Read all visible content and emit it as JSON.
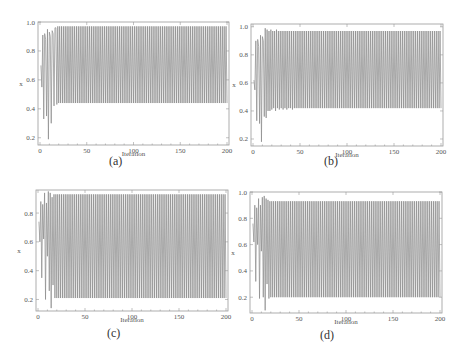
{
  "chart_data": [
    {
      "type": "line",
      "panel": "a",
      "caption": "(a)",
      "xlabel": "Iteration",
      "ylabel": "x",
      "xlim": [
        0,
        200
      ],
      "ylim": [
        0.15,
        1.0
      ],
      "xticks": [
        0,
        50,
        100,
        150,
        200
      ],
      "yticks": [
        0.2,
        0.4,
        0.6,
        0.8,
        1.0
      ],
      "ytick_labels": [
        "0.2",
        "0.4",
        "0.6",
        "0.8",
        "1.0"
      ],
      "steady_state": {
        "high": 0.97,
        "low": 0.44,
        "from_iteration": 18
      },
      "transient": [
        0.7,
        0.55,
        0.91,
        0.33,
        0.92,
        0.88,
        0.35,
        0.95,
        0.19,
        0.93,
        0.9,
        0.3,
        0.94,
        0.92,
        0.42,
        0.96,
        0.96,
        0.43
      ]
    },
    {
      "type": "line",
      "panel": "b",
      "caption": "(b)",
      "xlabel": "Iteration",
      "ylabel": "x",
      "xlim": [
        0,
        200
      ],
      "ylim": [
        0.15,
        1.02
      ],
      "xticks": [
        0,
        50,
        100,
        150,
        200
      ],
      "yticks": [
        0.2,
        0.4,
        0.6,
        0.8,
        1.0
      ],
      "ytick_labels": [
        "0.2",
        "0.4",
        "0.6",
        "0.8",
        "1.0"
      ],
      "steady_state": {
        "high": 0.97,
        "low": 0.42,
        "from_iteration": 45
      },
      "transient": [
        0.62,
        0.55,
        0.9,
        0.33,
        0.91,
        0.86,
        0.31,
        0.94,
        0.18,
        0.93,
        0.9,
        0.36,
        0.99,
        0.35,
        0.98,
        0.4,
        0.97,
        0.4,
        0.98,
        0.41,
        0.97,
        0.42,
        0.97,
        0.4,
        0.98,
        0.42,
        0.97,
        0.41,
        0.97,
        0.42,
        0.97,
        0.41,
        0.97,
        0.42,
        0.97,
        0.41,
        0.97,
        0.42,
        0.97,
        0.42,
        0.97,
        0.41,
        0.97,
        0.42,
        0.97
      ]
    },
    {
      "type": "line",
      "panel": "c",
      "caption": "(c)",
      "xlabel": "Iteration",
      "ylabel": "x",
      "xlim": [
        0,
        200
      ],
      "ylim": [
        0.12,
        0.96
      ],
      "xticks": [
        0,
        50,
        100,
        150,
        200
      ],
      "yticks": [
        0.2,
        0.4,
        0.6,
        0.8
      ],
      "ytick_labels": [
        "0.2",
        "0.4",
        "0.6",
        "0.8"
      ],
      "steady_state": {
        "high": 0.93,
        "low": 0.21,
        "from_iteration": 17
      },
      "transient": [
        0.74,
        0.6,
        0.88,
        0.35,
        0.86,
        0.62,
        0.94,
        0.2,
        0.87,
        0.5,
        0.95,
        0.26,
        0.94,
        0.14,
        0.91,
        0.3,
        0.93
      ]
    },
    {
      "type": "line",
      "panel": "d",
      "caption": "(d)",
      "xlabel": "Iteration",
      "ylabel": "x",
      "xlim": [
        0,
        200
      ],
      "ylim": [
        0.08,
        1.0
      ],
      "xticks": [
        0,
        50,
        100,
        150,
        200
      ],
      "yticks": [
        0.2,
        0.4,
        0.6,
        0.8,
        1.0
      ],
      "ytick_labels": [
        "0.2",
        "0.4",
        "0.6",
        "0.8",
        "1.0"
      ],
      "steady_state": {
        "high": 0.93,
        "low": 0.2,
        "from_iteration": 18
      },
      "transient": [
        0.76,
        0.62,
        0.9,
        0.32,
        0.88,
        0.6,
        0.95,
        0.19,
        0.9,
        0.55,
        0.96,
        0.2,
        0.97,
        0.1,
        0.95,
        0.3,
        0.94,
        0.19
      ]
    }
  ],
  "layout": {
    "panels": [
      {
        "left": 38,
        "top": 22,
        "width": 191,
        "height": 123,
        "caption_x": 118,
        "caption_y": 166,
        "xlabel_y": 156
      },
      {
        "left": 251,
        "top": 24,
        "width": 192,
        "height": 122,
        "caption_x": 333,
        "caption_y": 166,
        "xlabel_y": 157
      },
      {
        "left": 36,
        "top": 190,
        "width": 192,
        "height": 121,
        "caption_x": 116,
        "caption_y": 338,
        "xlabel_y": 322
      },
      {
        "left": 250,
        "top": 192,
        "width": 192,
        "height": 121,
        "caption_x": 329,
        "caption_y": 340,
        "xlabel_y": 324
      }
    ]
  }
}
